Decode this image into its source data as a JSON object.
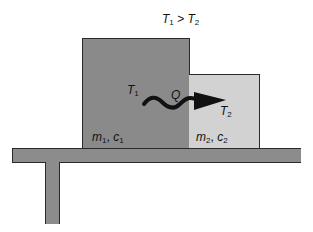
{
  "diagram": {
    "title_condition": {
      "left": "T",
      "left_sub": "1",
      "operator": " > ",
      "right": "T",
      "right_sub": "2"
    },
    "objects": [
      {
        "id": "body1",
        "temp": "T",
        "temp_sub": "1",
        "mass": "m",
        "mass_sub": "1",
        "heat_cap": "c",
        "heat_cap_sub": "1",
        "fill": "#8a8a8a"
      },
      {
        "id": "body2",
        "temp": "T",
        "temp_sub": "2",
        "mass": "m",
        "mass_sub": "2",
        "heat_cap": "c",
        "heat_cap_sub": "2",
        "fill": "#d2d2d2"
      }
    ],
    "heat_flow": {
      "label": "Q",
      "direction": "body1-to-body2",
      "icon": "wavy-arrow-icon",
      "color": "#111111"
    },
    "support": {
      "type": "table",
      "fill": "#8c8c8c"
    },
    "separator": ", "
  }
}
